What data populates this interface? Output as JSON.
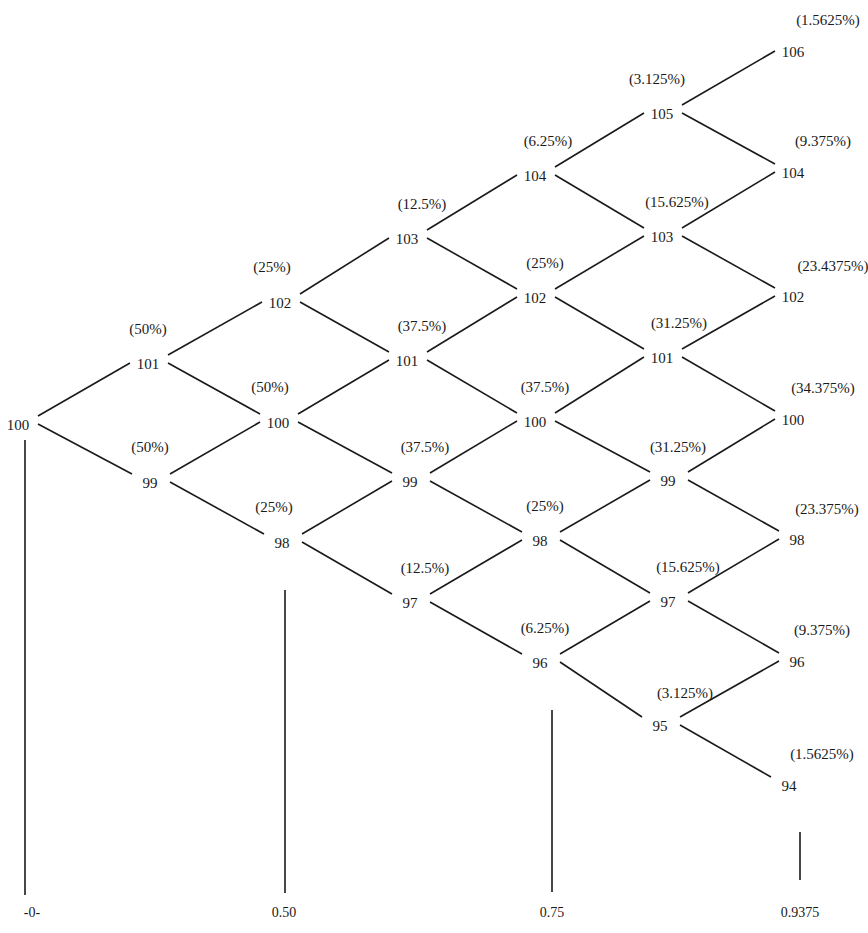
{
  "diagram": {
    "type": "binomial-price-tree",
    "levels": [
      [
        {
          "value": "100",
          "pct": ""
        }
      ],
      [
        {
          "value": "101",
          "pct": "(50%)"
        },
        {
          "value": "99",
          "pct": "(50%)"
        }
      ],
      [
        {
          "value": "102",
          "pct": "(25%)"
        },
        {
          "value": "100",
          "pct": "(50%)"
        },
        {
          "value": "98",
          "pct": "(25%)"
        }
      ],
      [
        {
          "value": "103",
          "pct": "(12.5%)"
        },
        {
          "value": "101",
          "pct": "(37.5%)"
        },
        {
          "value": "99",
          "pct": "(37.5%)"
        },
        {
          "value": "97",
          "pct": "(12.5%)"
        }
      ],
      [
        {
          "value": "104",
          "pct": "(6.25%)"
        },
        {
          "value": "102",
          "pct": "(25%)"
        },
        {
          "value": "100",
          "pct": "(37.5%)"
        },
        {
          "value": "98",
          "pct": "(25%)"
        },
        {
          "value": "96",
          "pct": "(6.25%)"
        }
      ],
      [
        {
          "value": "105",
          "pct": "(3.125%)"
        },
        {
          "value": "103",
          "pct": "(15.625%)"
        },
        {
          "value": "101",
          "pct": "(31.25%)"
        },
        {
          "value": "99",
          "pct": "(31.25%)"
        },
        {
          "value": "97",
          "pct": "(15.625%)"
        },
        {
          "value": "95",
          "pct": "(3.125%)"
        }
      ],
      [
        {
          "value": "106",
          "pct": "(1.5625%)"
        },
        {
          "value": "104",
          "pct": "(9.375%)"
        },
        {
          "value": "102",
          "pct": "(23.4375%)"
        },
        {
          "value": "100",
          "pct": "(34.375%)"
        },
        {
          "value": "98",
          "pct": "(23.375%)"
        },
        {
          "value": "96",
          "pct": "(9.375%)"
        },
        {
          "value": "94",
          "pct": "(1.5625%)"
        }
      ]
    ],
    "bars": [
      {
        "label": "-0-"
      },
      {
        "label": "0.50"
      },
      {
        "label": "0.75"
      },
      {
        "label": "0.9375"
      }
    ]
  }
}
